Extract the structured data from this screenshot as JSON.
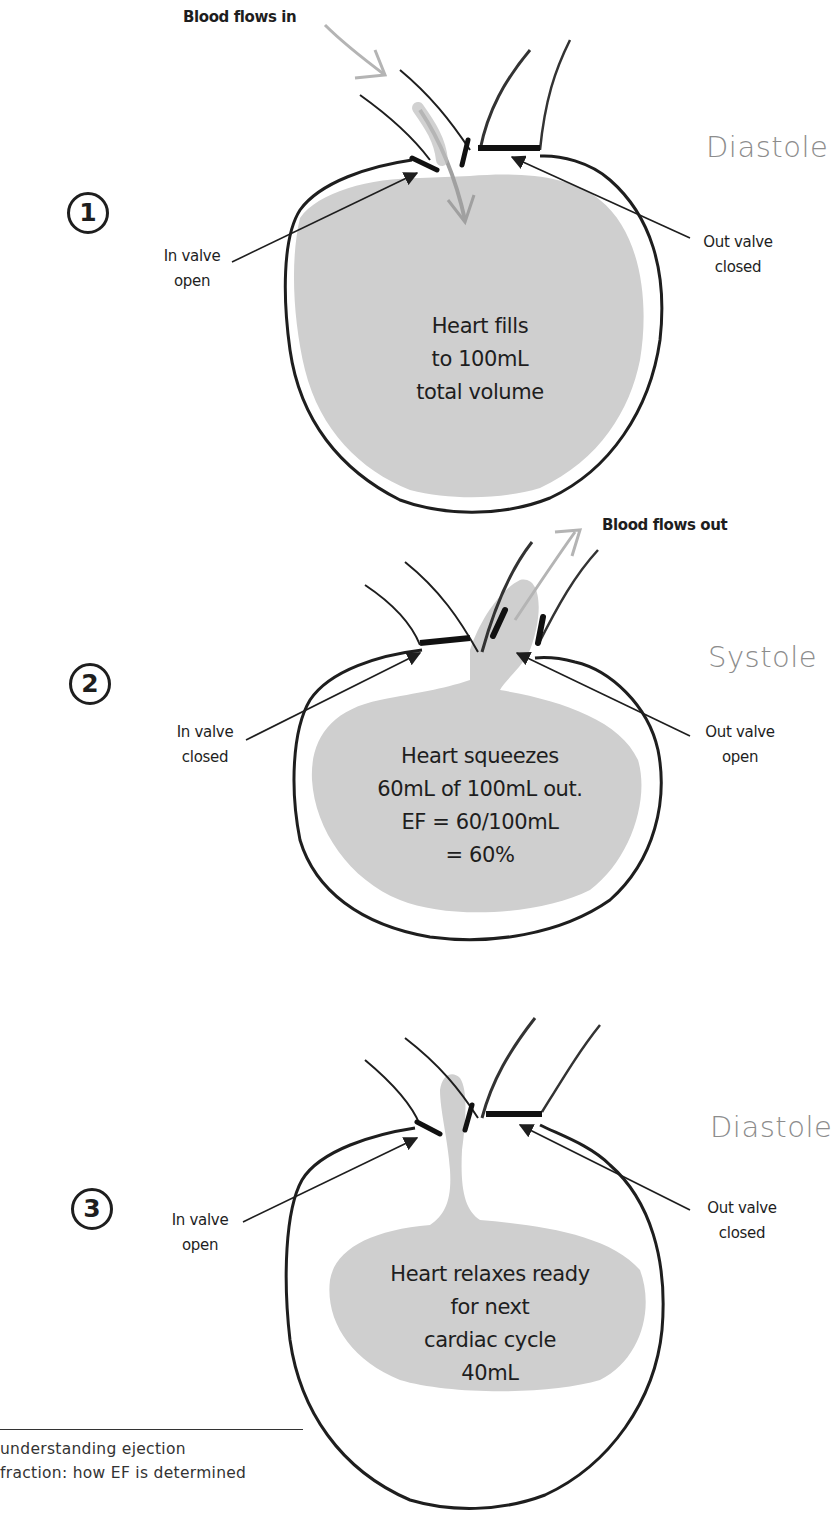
{
  "title": "understanding ejection fraction: how EF is determined",
  "colors": {
    "ink": "#1e1e1e",
    "fill": "#cfcfcf",
    "arrow_gray": "#b4b4b4",
    "phase_text": "#8c8c8c"
  },
  "panels": [
    {
      "step": "1",
      "phase": "Diastole",
      "flow_label": "Blood flows in",
      "in_valve": {
        "line1": "In valve",
        "line2": "open"
      },
      "out_valve": {
        "line1": "Out valve",
        "line2": "closed"
      },
      "inner_text": [
        "Heart fills",
        "to 100mL",
        "total volume"
      ]
    },
    {
      "step": "2",
      "phase": "Systole",
      "flow_label": "Blood flows out",
      "in_valve": {
        "line1": "In valve",
        "line2": "closed"
      },
      "out_valve": {
        "line1": "Out valve",
        "line2": "open"
      },
      "inner_text": [
        "Heart squeezes",
        "60mL of 100mL out.",
        "EF = 60/100mL",
        "= 60%"
      ]
    },
    {
      "step": "3",
      "phase": "Diastole",
      "in_valve": {
        "line1": "In valve",
        "line2": "open"
      },
      "out_valve": {
        "line1": "Out valve",
        "line2": "closed"
      },
      "inner_text": [
        "Heart relaxes ready",
        "for next",
        "cardiac cycle",
        "40mL"
      ]
    }
  ],
  "caption": {
    "line1": "understanding ejection",
    "line2": "fraction: how EF is determined"
  }
}
